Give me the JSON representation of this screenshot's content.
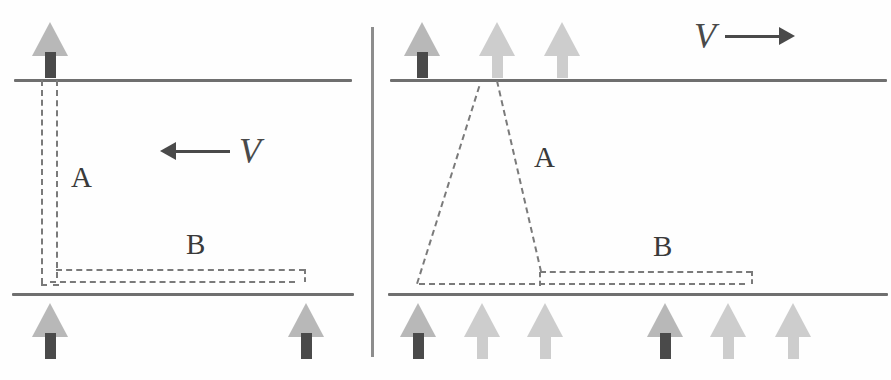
{
  "figure": {
    "width": 891,
    "height": 380,
    "background_color": "#fefefe",
    "divider_color": "#8d8d8d"
  },
  "colors": {
    "wall": "#6f6f6f",
    "dash": "#7a7a7a",
    "arrow_head": "#b8b8b8",
    "arrow_head_pale": "#cdcdcd",
    "arrow_stem_dark": "#4a4a4a",
    "arrow_stem_pale": "#cdcdcd",
    "label_text": "#3a3a3a",
    "velocity": "#4a4a4a"
  },
  "panels": [
    {
      "id": "left",
      "name": "upstream-migration-panel",
      "velocity": {
        "symbol": "V",
        "direction": "left",
        "arrow_glyph": "←",
        "label": "← V"
      },
      "walls": {
        "top_label": "upper-wall",
        "bottom_label": "lower-wall"
      },
      "trajectories": [
        {
          "id": "A",
          "label": "A",
          "shape": "narrow-vertical-pair"
        },
        {
          "id": "B",
          "label": "B",
          "shape": "horizontal-pair-along-lower-wall"
        }
      ],
      "arrows": {
        "top_row": [
          {
            "stem": "dark"
          }
        ],
        "bottom_row": [
          {
            "stem": "dark"
          },
          {
            "stem": "dark"
          }
        ]
      }
    },
    {
      "id": "right",
      "name": "downstream-migration-panel",
      "velocity": {
        "symbol": "V",
        "direction": "right",
        "arrow_glyph": "→",
        "label": "V →"
      },
      "walls": {
        "top_label": "upper-wall",
        "bottom_label": "lower-wall"
      },
      "trajectories": [
        {
          "id": "A",
          "label": "A",
          "shape": "tall-triangle-peak-at-upper-wall"
        },
        {
          "id": "B",
          "label": "B",
          "shape": "low-step-along-lower-wall"
        }
      ],
      "arrows": {
        "top_row": [
          {
            "stem": "dark"
          },
          {
            "stem": "pale"
          },
          {
            "stem": "pale"
          }
        ],
        "bottom_row": [
          {
            "stem": "dark"
          },
          {
            "stem": "pale"
          },
          {
            "stem": "pale"
          },
          {
            "stem": "dark"
          },
          {
            "stem": "pale"
          },
          {
            "stem": "pale"
          }
        ]
      }
    }
  ],
  "labels": {
    "left_A": "A",
    "left_B": "B",
    "right_A": "A",
    "right_B": "B",
    "left_V": "V",
    "right_V": "V"
  }
}
